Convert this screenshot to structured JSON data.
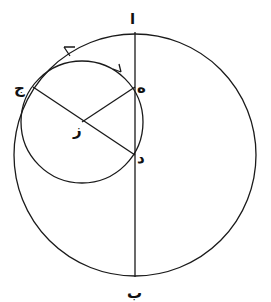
{
  "diagram": {
    "type": "geometric-construction",
    "outer_circle": {
      "cx": 135,
      "cy": 155,
      "r": 121
    },
    "inner_circle": {
      "cx": 82,
      "cy": 122,
      "r": 61
    },
    "vertical_line": {
      "x1": 135,
      "y1": 32,
      "x2": 135,
      "y2": 277
    },
    "segments": [
      {
        "from": "ج",
        "to": "د"
      },
      {
        "from": "ز",
        "to": "ه"
      }
    ],
    "points": {
      "alif": {
        "label": "ا",
        "x": 135,
        "y": 32
      },
      "ba": {
        "label": "ب",
        "x": 135,
        "y": 277
      },
      "jim": {
        "label": "ج",
        "x": 33,
        "y": 87
      },
      "ha": {
        "label": "ه",
        "x": 135,
        "y": 87
      },
      "dal": {
        "label": "د",
        "x": 135,
        "y": 155
      },
      "zay": {
        "label": "ز",
        "x": 82,
        "y": 122
      }
    },
    "arrows": [
      {
        "on": "outer_circle",
        "direction": "counter-clockwise",
        "x": 68,
        "y": 50
      },
      {
        "on": "inner_circle",
        "direction": "clockwise",
        "x": 118,
        "y": 70
      }
    ],
    "colors": {
      "ink": "#1a1a1a",
      "background": "#ffffff"
    }
  }
}
